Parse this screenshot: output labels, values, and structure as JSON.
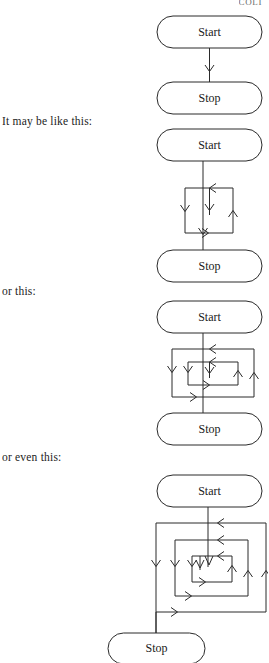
{
  "page": {
    "header_fragment": "COLI",
    "background_color": "#ffffff",
    "line_color": "#2a2a2a"
  },
  "captions": [
    {
      "id": "caption-1",
      "text": "It may be like this:"
    },
    {
      "id": "caption-2",
      "text": "or this:"
    },
    {
      "id": "caption-3",
      "text": "or even this:"
    }
  ],
  "diagrams": [
    {
      "id": "diagram-1",
      "description": "straight sequence",
      "loop_count": 0,
      "start_label": "Start",
      "stop_label": "Stop"
    },
    {
      "id": "diagram-2",
      "description": "single loop",
      "loop_count": 1,
      "start_label": "Start",
      "stop_label": "Stop"
    },
    {
      "id": "diagram-3",
      "description": "two nested loops",
      "loop_count": 2,
      "start_label": "Start",
      "stop_label": "Stop"
    },
    {
      "id": "diagram-4",
      "description": "three nested loops",
      "loop_count": 3,
      "start_label": "Start",
      "stop_label": "Stop"
    }
  ]
}
